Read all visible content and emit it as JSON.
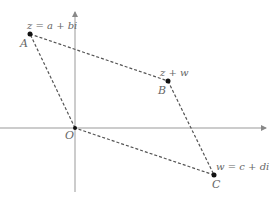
{
  "diagram": {
    "type": "complex-plane-parallelogram",
    "points": {
      "z": {
        "letter": "A",
        "expr": "z = a + bi"
      },
      "sum": {
        "letter": "B",
        "expr": "z + w"
      },
      "origin": {
        "letter": "O"
      },
      "w": {
        "letter": "C",
        "expr": "w = c + di"
      }
    },
    "colors": {
      "axis": "#888888",
      "dashed": "#555555",
      "point": "#111111",
      "label": "#666666"
    }
  }
}
